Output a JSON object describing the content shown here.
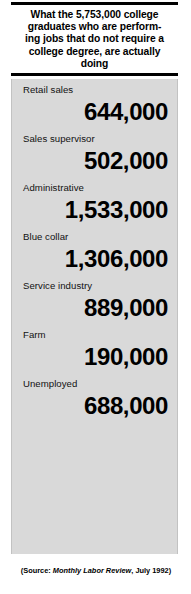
{
  "header": {
    "rule_top": "solid-black-bar",
    "rule_bottom": "solid-black-bar",
    "headline_lines": [
      "What the 5,753,000 college",
      "graduates who are perform-",
      "ing jobs that do not require a",
      "college degree, are actually",
      "doing"
    ],
    "headline_full": "What the 5,753,000 college graduates who are performing jobs that do not require a college degree, are actually doing"
  },
  "panel": {
    "background_color": "#d9d9d9",
    "border_color": "#c2c2c2"
  },
  "source": {
    "prefix": "(Source: ",
    "publication": "Monthly Labor Review",
    "suffix": ", July 1992)"
  },
  "chart_data": {
    "type": "table",
    "xlabel": "",
    "ylabel": "Number of graduates",
    "categories": [
      "Retail sales",
      "Sales supervisor",
      "Administrative",
      "Blue collar",
      "Service industry",
      "Farm",
      "Unemployed"
    ],
    "values": [
      644000,
      502000,
      1533000,
      1306000,
      889000,
      190000,
      688000
    ],
    "value_labels": [
      "644,000",
      "502,000",
      "1,533,000",
      "1,306,000",
      "889,000",
      "190,000",
      "688,000"
    ],
    "total": 5753000,
    "total_label": "5,753,000",
    "source": "Monthly Labor Review, July 1992",
    "rows": [
      {
        "label": "Retail sales",
        "value": "644,000"
      },
      {
        "label": "Sales supervisor",
        "value": "502,000"
      },
      {
        "label": "Administrative",
        "value": "1,533,000"
      },
      {
        "label": "Blue collar",
        "value": "1,306,000"
      },
      {
        "label": "Service industry",
        "value": "889,000"
      },
      {
        "label": "Farm",
        "value": "190,000"
      },
      {
        "label": "Unemployed",
        "value": "688,000"
      }
    ]
  }
}
